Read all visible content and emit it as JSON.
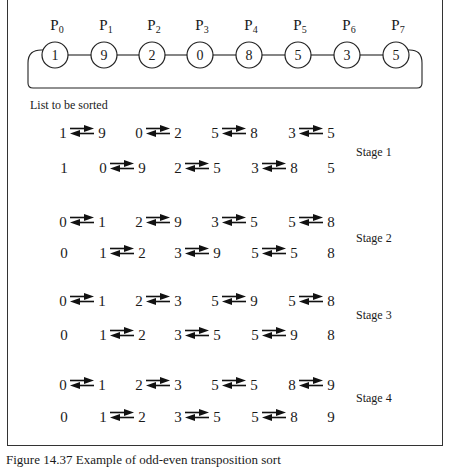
{
  "processors": [
    {
      "label": "P",
      "sub": "0",
      "value": "1"
    },
    {
      "label": "P",
      "sub": "1",
      "value": "9"
    },
    {
      "label": "P",
      "sub": "2",
      "value": "2"
    },
    {
      "label": "P",
      "sub": "3",
      "value": "0"
    },
    {
      "label": "P",
      "sub": "4",
      "value": "8"
    },
    {
      "label": "P",
      "sub": "5",
      "value": "5"
    },
    {
      "label": "P",
      "sub": "6",
      "value": "3"
    },
    {
      "label": "P",
      "sub": "7",
      "value": "5"
    }
  ],
  "list_caption": "List to be sorted",
  "stages": [
    {
      "label": "Stage 1",
      "even_phase": [
        [
          "1",
          "9"
        ],
        [
          "0",
          "2"
        ],
        [
          "5",
          "8"
        ],
        [
          "3",
          "5"
        ]
      ],
      "odd_phase": {
        "first": "1",
        "pairs": [
          [
            "0",
            "9"
          ],
          [
            "2",
            "5"
          ],
          [
            "3",
            "8"
          ]
        ],
        "last": "5"
      }
    },
    {
      "label": "Stage 2",
      "even_phase": [
        [
          "0",
          "1"
        ],
        [
          "2",
          "9"
        ],
        [
          "3",
          "5"
        ],
        [
          "5",
          "8"
        ]
      ],
      "odd_phase": {
        "first": "0",
        "pairs": [
          [
            "1",
            "2"
          ],
          [
            "3",
            "9"
          ],
          [
            "5",
            "5"
          ]
        ],
        "last": "8"
      }
    },
    {
      "label": "Stage 3",
      "even_phase": [
        [
          "0",
          "1"
        ],
        [
          "2",
          "3"
        ],
        [
          "5",
          "9"
        ],
        [
          "5",
          "8"
        ]
      ],
      "odd_phase": {
        "first": "0",
        "pairs": [
          [
            "1",
            "2"
          ],
          [
            "3",
            "5"
          ],
          [
            "5",
            "9"
          ]
        ],
        "last": "8"
      }
    },
    {
      "label": "Stage 4",
      "even_phase": [
        [
          "0",
          "1"
        ],
        [
          "2",
          "3"
        ],
        [
          "5",
          "5"
        ],
        [
          "8",
          "9"
        ]
      ],
      "odd_phase": {
        "first": "0",
        "pairs": [
          [
            "1",
            "2"
          ],
          [
            "3",
            "5"
          ],
          [
            "5",
            "8"
          ]
        ],
        "last": "9"
      }
    }
  ],
  "figure_caption": "Figure 14.37   Example of odd-even transposition sort"
}
